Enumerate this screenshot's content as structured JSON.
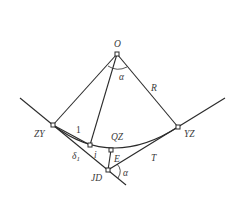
{
  "diagram": {
    "labels": {
      "center": "O",
      "angle_at_center": "α",
      "radius": "R",
      "curve_start": "ZY",
      "curve_end": "YZ",
      "curve_mid": "QZ",
      "external": "E",
      "tangent": "T",
      "intersection": "JD",
      "deflection_angle": "α",
      "point_1": "1",
      "point_i": "i",
      "delta_1": "δ",
      "delta_1_sub": "1"
    },
    "points": {
      "O": [
        117,
        54
      ],
      "ZY": [
        53,
        125
      ],
      "YZ": [
        178,
        127
      ],
      "QZ": [
        111,
        150
      ],
      "JD": [
        108,
        170
      ],
      "P1": [
        90,
        145
      ]
    },
    "line_color": "#2b2b2b"
  }
}
